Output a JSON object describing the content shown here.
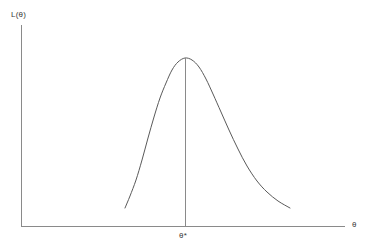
{
  "figure": {
    "background_color": "#ffffff",
    "axis_color": "#8a8a8a",
    "curve_color": "#5a5a5a",
    "text_color": "#3a3a3a"
  },
  "labels": {
    "y_axis": "L(θ)",
    "x_axis": "θ",
    "peak_marker": "θ*"
  },
  "chart_data": {
    "type": "line",
    "title": "",
    "subtitle": "",
    "xlabel": "θ",
    "ylabel": "L(θ)",
    "grid": false,
    "legend": null,
    "annotations": [
      {
        "text": "θ*",
        "description": "maximum likelihood estimate; vertical dropline from curve peak to x-axis",
        "x_pixel": 185,
        "y_pixel": 237
      }
    ],
    "axes": {
      "x_axis_pixel_y": 226,
      "x_axis_pixel_x_start": 21,
      "x_axis_pixel_x_end": 345,
      "y_axis_pixel_x": 21,
      "y_axis_pixel_y_start": 25,
      "y_axis_pixel_y_end": 226,
      "ticks_x": [],
      "ticks_y": [],
      "xlim_pixel": [
        21,
        345
      ],
      "ylim_pixel": [
        226,
        25
      ]
    },
    "series": [
      {
        "name": "likelihood",
        "description": "asymmetric unimodal likelihood curve, peak at theta-star, longer right tail",
        "points_pixel": [
          [
            125,
            208
          ],
          [
            130,
            196
          ],
          [
            136,
            180
          ],
          [
            142,
            160
          ],
          [
            148,
            138
          ],
          [
            154,
            117
          ],
          [
            160,
            98
          ],
          [
            166,
            83
          ],
          [
            172,
            70
          ],
          [
            178,
            62
          ],
          [
            185,
            58
          ],
          [
            192,
            60
          ],
          [
            199,
            67
          ],
          [
            206,
            79
          ],
          [
            213,
            94
          ],
          [
            221,
            112
          ],
          [
            229,
            130
          ],
          [
            238,
            149
          ],
          [
            247,
            166
          ],
          [
            257,
            181
          ],
          [
            267,
            192
          ],
          [
            278,
            201
          ],
          [
            290,
            208
          ]
        ]
      }
    ],
    "dropline": {
      "x_pixel": 185,
      "y_top_pixel": 58,
      "y_bottom_pixel": 226
    }
  }
}
